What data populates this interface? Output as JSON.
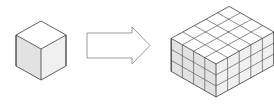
{
  "figure": {
    "background_color": "#ffffff",
    "width": 274,
    "height": 106
  },
  "palette": {
    "top_face": "#ffffff",
    "left_face": "#e2e2e2",
    "right_face": "#f0f0f0",
    "outline": "#3a3a3a",
    "grid_line": "#8a8a8a",
    "grid_line_dark": "#5a5a5a",
    "arrow_outline": "#8e8e8e",
    "arrow_fill": "#ffffff"
  },
  "shapes": {
    "unit_cube": {
      "name": "unit-cube",
      "label": "",
      "cells_x": 1,
      "cells_y": 1,
      "cells_z": 1,
      "total_cubes": 1,
      "origin_x": 41,
      "origin_y": 80,
      "cell_width": 25,
      "cell_depth_dx": 25,
      "cell_depth_dy": -14,
      "cell_height": 31
    },
    "arrow": {
      "name": "right-arrow",
      "label": "",
      "direction": "right",
      "x": 87,
      "y": 33,
      "shaft_width": 45,
      "shaft_height": 25,
      "head_length": 18,
      "head_height": 37
    },
    "cube_block": {
      "name": "cube-block",
      "label": "",
      "cells_x": 5,
      "cells_y": 4,
      "cells_z": 3,
      "total_cubes": 60,
      "origin_x": 216,
      "origin_y": 97,
      "cell_width": 11.6,
      "cell_depth_dx": 11.2,
      "cell_depth_dy": -6.4,
      "cell_height": 11.0
    }
  },
  "chart_data": {
    "type": "diagram",
    "items": [
      {
        "name": "unit cube",
        "dimensions": "1 x 1 x 1",
        "cube_count": 1
      },
      {
        "name": "arrow",
        "dimensions": "",
        "cube_count": 0
      },
      {
        "name": "cube block",
        "dimensions": "5 x 4 x 3",
        "cube_count": 60
      }
    ]
  }
}
